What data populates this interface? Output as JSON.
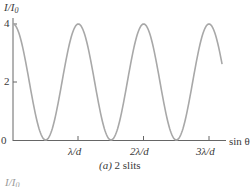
{
  "chart_data": {
    "type": "line",
    "title": "(a) 2 slits",
    "xlabel": "sin θ",
    "ylabel": "I/I₀",
    "y_ticks": [
      "0",
      "2",
      "4"
    ],
    "x_ticks": [
      "λ/d",
      "2λ/d",
      "3λ/d"
    ],
    "ylim": [
      0,
      4
    ],
    "xlim": [
      0,
      3.3
    ],
    "grid": false,
    "legend": null,
    "function": "I/I0 = 4 cos²(π d sinθ / λ)",
    "x": [
      0,
      0.25,
      0.5,
      0.75,
      1.0,
      1.25,
      1.5,
      1.75,
      2.0,
      2.25,
      2.5,
      2.75,
      3.0,
      3.2
    ],
    "series": [
      {
        "name": "2 slits",
        "values": [
          4,
          2,
          0,
          2,
          4,
          2,
          0,
          2,
          4,
          2,
          0,
          2,
          4,
          2.4
        ]
      }
    ],
    "maxima_at": [
      0,
      1,
      2,
      3
    ],
    "minima_at": [
      0.5,
      1.5,
      2.5
    ]
  },
  "labels": {
    "y_axis_main": "I",
    "y_axis_slash": "/",
    "y_axis_I": "I",
    "y_axis_sub": "0",
    "tick_0": "0",
    "tick_2": "2",
    "tick_4": "4",
    "x_tick_1": "λ/d",
    "x_tick_2": "2λ/d",
    "x_tick_3": "3λ/d",
    "x_axis": "sin θ",
    "caption_part": "(a)",
    "caption_text": " 2 slits",
    "next_chart_ylabel_I": "I",
    "next_chart_ylabel_slash": "/",
    "next_chart_ylabel_I0": "I",
    "next_chart_ylabel_sub": "0"
  },
  "colors": {
    "curve": "#a8a8a8",
    "axis": "#555555",
    "text": "#3a3a3a"
  }
}
